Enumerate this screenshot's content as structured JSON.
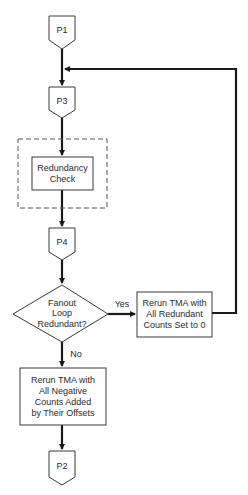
{
  "diagram": {
    "type": "flowchart",
    "nodes": {
      "p1": {
        "label": "P1",
        "kind": "off-page-connector"
      },
      "p3": {
        "label": "P3",
        "kind": "off-page-connector"
      },
      "redundancy_check": {
        "lines": [
          "Redundancy",
          "Check"
        ],
        "kind": "process",
        "grouped": "dashed-boundary"
      },
      "p4": {
        "label": "P4",
        "kind": "off-page-connector"
      },
      "decision": {
        "lines": [
          "Fanout",
          "Loop",
          "Redundant?"
        ],
        "kind": "decision"
      },
      "rerun_redundant": {
        "lines": [
          "Rerun TMA with",
          "All Redundant",
          "Counts Set to 0"
        ],
        "kind": "process"
      },
      "rerun_negative": {
        "lines": [
          "Rerun TMA with",
          "All Negative",
          "Counts Added",
          "by Their Offsets"
        ],
        "kind": "process"
      },
      "p2": {
        "label": "P2",
        "kind": "off-page-connector"
      }
    },
    "edges": [
      {
        "from": "p1",
        "to": "p3",
        "label": ""
      },
      {
        "from": "p3",
        "to": "redundancy_check",
        "label": ""
      },
      {
        "from": "redundancy_check",
        "to": "p4",
        "label": ""
      },
      {
        "from": "p4",
        "to": "decision",
        "label": ""
      },
      {
        "from": "decision",
        "to": "rerun_redundant",
        "label": "Yes"
      },
      {
        "from": "decision",
        "to": "rerun_negative",
        "label": "No"
      },
      {
        "from": "rerun_redundant",
        "to": "p3",
        "label": "",
        "note": "feedback loop"
      },
      {
        "from": "rerun_negative",
        "to": "p2",
        "label": ""
      }
    ],
    "edge_labels": {
      "yes": "Yes",
      "no": "No"
    }
  }
}
